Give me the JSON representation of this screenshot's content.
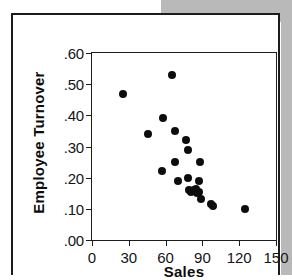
{
  "figure": {
    "background_color": "#ffffff",
    "shadow_color": "#b9b9b9",
    "border_color": "#1c1c1c",
    "marker_color": "#0d0d0d"
  },
  "chart_data": {
    "type": "scatter",
    "title": "",
    "xlabel": "Sales",
    "ylabel": "Employee Turnover",
    "xlim": [
      0,
      150
    ],
    "ylim": [
      0.0,
      0.6
    ],
    "grid": false,
    "legend": null,
    "xticks": [
      0,
      30,
      60,
      90,
      120,
      150
    ],
    "xtick_labels": [
      "0",
      "30",
      "60",
      "90",
      "120",
      "150"
    ],
    "yticks": [
      0.0,
      0.1,
      0.2,
      0.3,
      0.4,
      0.5,
      0.6
    ],
    "ytick_labels": [
      ".00",
      ".10",
      ".20",
      ".30",
      ".40",
      ".50",
      ".60"
    ],
    "series": [
      {
        "name": "stores",
        "marker": "circle",
        "color": "#0d0d0d",
        "x": [
          25,
          46,
          57,
          58,
          65,
          68,
          68,
          70,
          77,
          78,
          78,
          79,
          81,
          83,
          85,
          86,
          87,
          87,
          88,
          89,
          97,
          99,
          125
        ],
        "y": [
          0.47,
          0.34,
          0.22,
          0.39,
          0.53,
          0.25,
          0.35,
          0.19,
          0.32,
          0.2,
          0.29,
          0.16,
          0.155,
          0.16,
          0.165,
          0.15,
          0.155,
          0.19,
          0.25,
          0.13,
          0.115,
          0.11,
          0.1
        ]
      }
    ]
  }
}
